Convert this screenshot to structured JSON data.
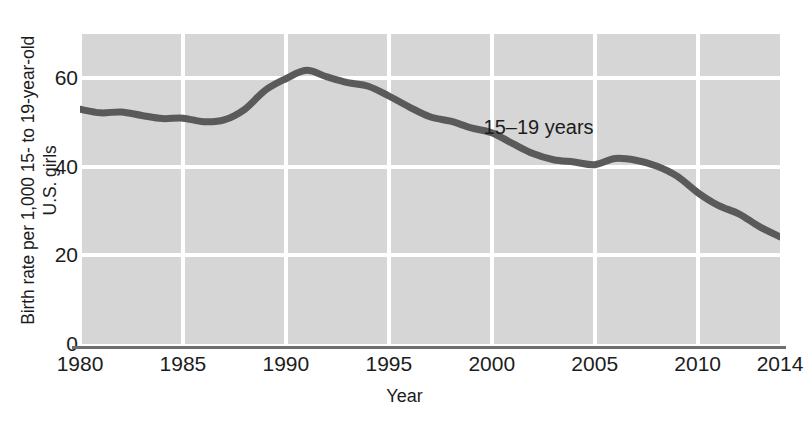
{
  "chart_data": {
    "type": "line",
    "title": "",
    "subtitle": "",
    "xlabel": "Year",
    "ylabel": "Birth rate per 1,000 15- to 19-year-old U.S. girls",
    "ylabel_lines": [
      "Birth rate per 1,000 15- to 19-year-old",
      "U.S. girls"
    ],
    "xlim": [
      1980,
      2014
    ],
    "ylim": [
      0,
      70
    ],
    "x_tick_labels": [
      "1980",
      "1985",
      "1990",
      "1995",
      "2000",
      "2005",
      "2010",
      "2014"
    ],
    "x_ticks": [
      1980,
      1985,
      1990,
      1995,
      2000,
      2005,
      2010,
      2014
    ],
    "y_tick_labels": [
      "0",
      "20",
      "40",
      "60"
    ],
    "y_ticks": [
      0,
      20,
      40,
      60
    ],
    "grid": "white gridlines on gray panel, both axes at major ticks",
    "legend": "none; inline annotation on series",
    "legend_position": "inline-right-of-series",
    "plot_background_color": "#d6d6d6",
    "gridline_color": "#ffffff",
    "axis_line_color": "#6e6e6e",
    "series": [
      {
        "name": "15–19 years",
        "annotation": "15–19 years",
        "color": "#5a5a5a",
        "line_width_px": 7,
        "x": [
          1980,
          1981,
          1982,
          1983,
          1984,
          1985,
          1986,
          1987,
          1988,
          1989,
          1990,
          1991,
          1992,
          1993,
          1994,
          1995,
          1996,
          1997,
          1998,
          1999,
          2000,
          2001,
          2002,
          2003,
          2004,
          2005,
          2006,
          2007,
          2008,
          2009,
          2010,
          2011,
          2012,
          2013,
          2014
        ],
        "values": [
          53.0,
          52.2,
          52.4,
          51.6,
          50.9,
          51.0,
          50.2,
          50.6,
          53.0,
          57.3,
          59.9,
          61.8,
          60.3,
          59.0,
          58.2,
          56.0,
          53.5,
          51.3,
          50.3,
          48.8,
          47.7,
          45.3,
          43.0,
          41.6,
          41.1,
          40.5,
          41.9,
          41.5,
          40.2,
          37.9,
          34.2,
          31.3,
          29.4,
          26.5,
          24.2
        ]
      }
    ]
  },
  "annotations": {
    "series_label": "15–19 years"
  }
}
